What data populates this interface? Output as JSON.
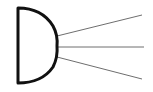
{
  "diagram": {
    "background": "#ffffff",
    "body_shape": {
      "kind": "d-shape",
      "stroke": "#111111",
      "stroke_width": 3,
      "fill": "#ffffff",
      "path": "M18 8 L18 83 Q42 83 53 67 Q58 57 57 46 Q58 35 53 26 Q42 8 18 8 Z"
    },
    "rays": [
      {
        "name": "ray-top",
        "x1": 57,
        "y1": 36,
        "x2": 142,
        "y2": 15
      },
      {
        "name": "ray-middle",
        "x1": 58,
        "y1": 47,
        "x2": 144,
        "y2": 47
      },
      {
        "name": "ray-bottom",
        "x1": 57,
        "y1": 57,
        "x2": 142,
        "y2": 79
      }
    ],
    "ray_color": "#6e6e6e",
    "ray_width": 1
  }
}
